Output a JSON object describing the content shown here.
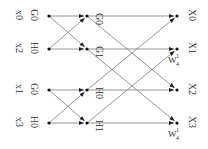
{
  "colors": {
    "line": "#8a8a8a",
    "arrow": "#222222",
    "node": "#111111",
    "text": "#333333"
  },
  "inputs": [
    {
      "label": "x0",
      "stage_label": "G0",
      "x": 49,
      "y": 16
    },
    {
      "label": "x2",
      "stage_label": "H0",
      "x": 49,
      "y": 49
    },
    {
      "label": "x1",
      "stage_label": "G0",
      "x": 49,
      "y": 90
    },
    {
      "label": "x3",
      "stage_label": "H0",
      "x": 49,
      "y": 123
    }
  ],
  "middle": [
    {
      "label": "G0",
      "x": 87,
      "y": 16
    },
    {
      "label": "G1",
      "x": 87,
      "y": 49
    },
    {
      "label": "H0",
      "x": 87,
      "y": 90
    },
    {
      "label": "H1",
      "x": 87,
      "y": 123
    }
  ],
  "outputs": [
    {
      "label": "X0",
      "x": 177,
      "y": 16,
      "twiddle": null
    },
    {
      "label": "X1",
      "x": 177,
      "y": 49,
      "twiddle": {
        "base": "W",
        "sup": "1",
        "sub": "4"
      }
    },
    {
      "label": "X2",
      "x": 177,
      "y": 90,
      "twiddle": null
    },
    {
      "label": "X3",
      "x": 177,
      "y": 123,
      "twiddle": {
        "base": "W",
        "sup": "1",
        "sub": "4"
      }
    }
  ],
  "edges_stage1": [
    [
      0,
      0
    ],
    [
      0,
      1
    ],
    [
      1,
      0
    ],
    [
      1,
      1
    ],
    [
      2,
      2
    ],
    [
      2,
      3
    ],
    [
      3,
      2
    ],
    [
      3,
      3
    ]
  ],
  "edges_stage2": [
    [
      0,
      0
    ],
    [
      0,
      2
    ],
    [
      1,
      1
    ],
    [
      1,
      3
    ],
    [
      2,
      0
    ],
    [
      2,
      2
    ],
    [
      3,
      1
    ],
    [
      3,
      3
    ]
  ]
}
